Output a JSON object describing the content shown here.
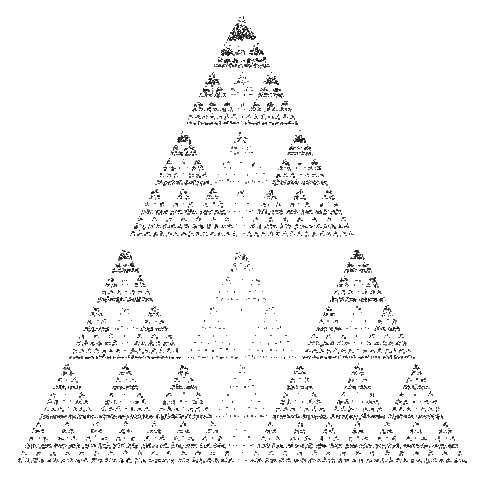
{
  "image": {
    "description": "Self-similar triangular fractal made of stippled black dots on white background",
    "background_color": "#ffffff",
    "dot_color": "#1a1a1a",
    "width": 481,
    "height": 503
  },
  "fractal": {
    "apex": [
      241,
      10
    ],
    "base_left": [
      8,
      478
    ],
    "base_right": [
      473,
      478
    ],
    "rows_per_level": 5,
    "recursion_depth": 4,
    "center_child_weight": 0.3,
    "dots_per_unit_area": 0.55,
    "structure": [
      {
        "row": 0,
        "count": 1,
        "scale": 0.5
      },
      {
        "row": 1,
        "count": 3,
        "scale": 0.25
      },
      {
        "row": 2,
        "count": 7,
        "scale": 0.125
      },
      {
        "row": 3,
        "count": 15,
        "scale": 0.0625
      }
    ]
  }
}
